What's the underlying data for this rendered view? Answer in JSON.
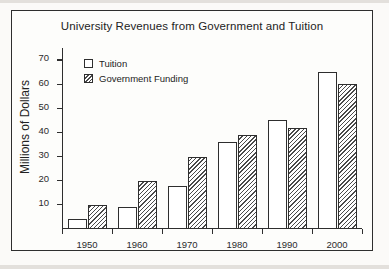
{
  "chart_data": {
    "type": "bar",
    "title": "University Revenues from Government and Tuition",
    "xlabel": "",
    "ylabel": "Millions of Dollars",
    "categories": [
      "1950",
      "1960",
      "1970",
      "1980",
      "1990",
      "2000"
    ],
    "series": [
      {
        "name": "Tuition",
        "values": [
          4,
          9,
          18,
          36,
          45,
          65
        ]
      },
      {
        "name": "Government Funding",
        "values": [
          10,
          20,
          30,
          39,
          42,
          60
        ]
      }
    ],
    "ylim": [
      0,
      75
    ],
    "yticks": [
      10,
      20,
      30,
      40,
      50,
      60,
      70
    ],
    "ytick_labels": [
      "10",
      "20",
      "30",
      "40",
      "50",
      "60",
      "70"
    ],
    "grid": false,
    "legend_position": "top-left",
    "legend": [
      {
        "label": "Tuition",
        "swatch": "open-square"
      },
      {
        "label": "Government Funding",
        "swatch": "hatched-square"
      }
    ],
    "colors": {
      "tuition_fill": "#ffffff",
      "government_hatch": "#4a4a4a",
      "axis": "#2e2e2e",
      "text": "#232323",
      "background": "#fdfdfb"
    }
  }
}
